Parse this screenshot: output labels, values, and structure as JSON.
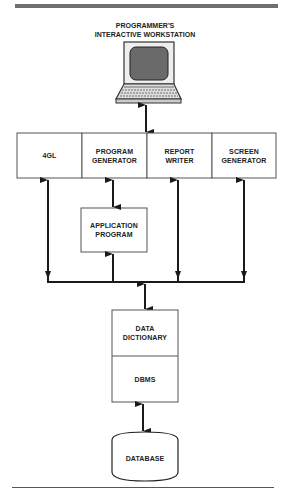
{
  "diagram": {
    "title_line1": "PROGRAMMER'S",
    "title_line2": "INTERACTIVE WORKSTATION",
    "workstation_icon": "laptop-computer-icon",
    "tools": [
      {
        "id": "4gl",
        "line1": "4GL",
        "line2": ""
      },
      {
        "id": "program-generator",
        "line1": "PROGRAM",
        "line2": "GENERATOR"
      },
      {
        "id": "report-writer",
        "line1": "REPORT",
        "line2": "WRITER"
      },
      {
        "id": "screen-generator",
        "line1": "SCREEN",
        "line2": "GENERATOR"
      }
    ],
    "application_program": {
      "line1": "APPLICATION",
      "line2": "PROGRAM"
    },
    "data_dictionary": {
      "line1": "DATA",
      "line2": "DICTIONARY"
    },
    "dbms": {
      "label": "DBMS"
    },
    "database": {
      "label": "DATABASE"
    },
    "colors": {
      "line": "#1a1a1a",
      "box_border": "#555555",
      "screen_fill": "#6a6a6a",
      "rule": "#6f6f6f"
    },
    "connections": [
      {
        "from": "workstation",
        "to": "tool-row",
        "type": "bidirectional"
      },
      {
        "from": "program-generator",
        "to": "application-program",
        "type": "bidirectional"
      },
      {
        "from": "application-program",
        "to": "bus",
        "type": "bidirectional"
      },
      {
        "from": "bus",
        "to": "4gl",
        "type": "bidirectional"
      },
      {
        "from": "bus",
        "to": "report-writer",
        "type": "bidirectional"
      },
      {
        "from": "bus",
        "to": "screen-generator",
        "type": "bidirectional"
      },
      {
        "from": "bus",
        "to": "data-dictionary",
        "type": "bidirectional"
      },
      {
        "from": "dbms",
        "to": "database",
        "type": "bidirectional"
      }
    ]
  }
}
